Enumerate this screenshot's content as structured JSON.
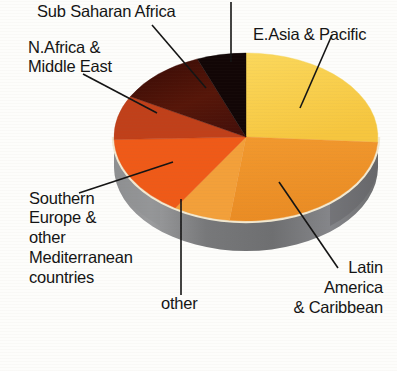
{
  "page": {
    "background_color": "#fdfdfb",
    "text_color": "#141414"
  },
  "chart_data": {
    "type": "pie",
    "title": "",
    "subtitle": "",
    "xlabel": "",
    "ylabel": "",
    "legend_position": "none",
    "grid": false,
    "style": "3d-pie-with-leader-lines",
    "start_angle_deg": 0,
    "direction": "clockwise",
    "total": 100,
    "categories": [
      "E.Asia & Pacific",
      "Latin America & Caribbean",
      "other",
      "Southern Europe & other Mediterranean countries",
      "N.Africa & Middle East",
      "Sub Saharan Africa",
      "unlabelled"
    ],
    "values": [
      26,
      26,
      7,
      15.5,
      8.5,
      11,
      6
    ],
    "colors": [
      "#fad14e",
      "#f0952a",
      "#f5a641",
      "#ef5a18",
      "#c0401a",
      "#4a1008",
      "#120606"
    ],
    "slices": [
      {
        "label": "E.Asia & Pacific",
        "value": 26,
        "color": "#fad14e",
        "start_deg": 0,
        "end_deg": 93.6
      },
      {
        "label": "Latin America & Caribbean",
        "value": 26,
        "color": "#f0952a",
        "start_deg": 93.6,
        "end_deg": 187.2
      },
      {
        "label": "other",
        "value": 7,
        "color": "#f5a641",
        "start_deg": 187.2,
        "end_deg": 212.4
      },
      {
        "label": "Southern Europe & other Mediterranean countries",
        "value": 15.5,
        "color": "#ef5a18",
        "start_deg": 212.4,
        "end_deg": 268.2
      },
      {
        "label": "N.Africa & Middle East",
        "value": 8.5,
        "color": "#c0401a",
        "start_deg": 268.2,
        "end_deg": 298.8
      },
      {
        "label": "Sub Saharan Africa",
        "value": 11,
        "color": "#4a1008",
        "start_deg": 298.8,
        "end_deg": 338.4
      },
      {
        "label": "unlabelled",
        "value": 6,
        "color": "#120606",
        "start_deg": 338.4,
        "end_deg": 360
      }
    ],
    "side_color": "#77787a",
    "rim_highlight_color": "#f3ead2"
  },
  "labels": {
    "sub_saharan_africa": "Sub Saharan Africa",
    "n_africa_middle_east_line1": "N.Africa &",
    "n_africa_middle_east_line2": "Middle East",
    "e_asia_pacific": "E.Asia & Pacific",
    "southern_europe_line1": "Southern",
    "southern_europe_line2": "Europe &",
    "southern_europe_line3": "other",
    "southern_europe_line4": "Mediterranean",
    "southern_europe_line5": "countries",
    "other": "other",
    "latin_america_line1": "Latin",
    "latin_america_line2": "America",
    "latin_america_line3": "& Caribbean"
  }
}
